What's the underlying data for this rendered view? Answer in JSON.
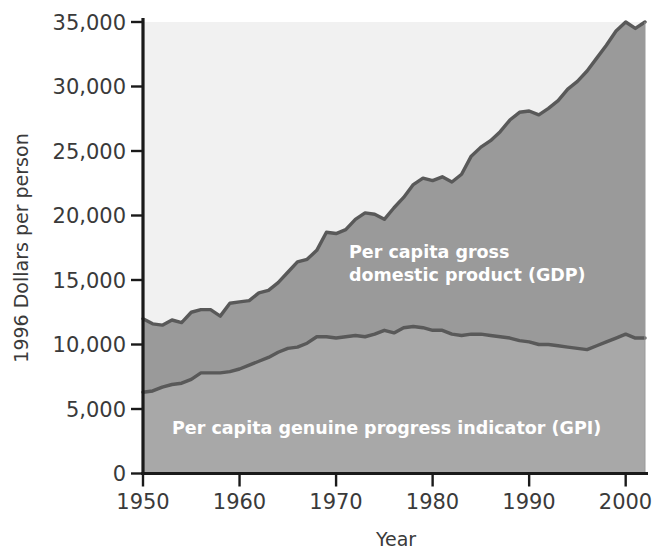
{
  "chart_data": {
    "type": "area",
    "title": "",
    "xlabel": "Year",
    "ylabel": "1996 Dollars per person",
    "xlim": [
      1950,
      2002
    ],
    "ylim": [
      0,
      35000
    ],
    "grid": false,
    "legend_position": "inline-annotation",
    "xticks": [
      "1950",
      "1960",
      "1970",
      "1980",
      "1990",
      "2000"
    ],
    "xtick_values": [
      1950,
      1960,
      1970,
      1980,
      1990,
      2000
    ],
    "yticks": [
      "0",
      "5,000",
      "10,000",
      "15,000",
      "20,000",
      "25,000",
      "30,000",
      "35,000"
    ],
    "ytick_values": [
      0,
      5000,
      10000,
      15000,
      20000,
      25000,
      30000,
      35000
    ],
    "x": [
      1950,
      1951,
      1952,
      1953,
      1954,
      1955,
      1956,
      1957,
      1958,
      1959,
      1960,
      1961,
      1962,
      1963,
      1964,
      1965,
      1966,
      1967,
      1968,
      1969,
      1970,
      1971,
      1972,
      1973,
      1974,
      1975,
      1976,
      1977,
      1978,
      1979,
      1980,
      1981,
      1982,
      1983,
      1984,
      1985,
      1986,
      1987,
      1988,
      1989,
      1990,
      1991,
      1992,
      1993,
      1994,
      1995,
      1996,
      1997,
      1998,
      1999,
      2000,
      2001,
      2002
    ],
    "series": [
      {
        "name": "Per capita gross domestic product (GDP)",
        "label": "Per capita gross domestic product (GDP)",
        "color": "#9a9a9a",
        "line_color": "#595959",
        "values": [
          12000,
          11600,
          11500,
          11900,
          11700,
          12500,
          12700,
          12700,
          12200,
          13200,
          13300,
          13400,
          14000,
          14200,
          14800,
          15600,
          16400,
          16600,
          17300,
          18700,
          18600,
          18900,
          19700,
          20200,
          20100,
          19700,
          20600,
          21400,
          22400,
          22900,
          22700,
          23000,
          22600,
          23200,
          24600,
          25300,
          25800,
          26500,
          27400,
          28000,
          28100,
          27800,
          28300,
          28900,
          29800,
          30400,
          31200,
          32200,
          33200,
          34300,
          35000,
          34500,
          35000
        ]
      },
      {
        "name": "Per capita genuine progress indicator (GPI)",
        "label": "Per capita genuine progress indicator (GPI)",
        "color": "#a8a8a8",
        "line_color": "#595959",
        "values": [
          6300,
          6400,
          6700,
          6900,
          7000,
          7300,
          7800,
          7800,
          7800,
          7900,
          8100,
          8400,
          8700,
          9000,
          9400,
          9700,
          9800,
          10100,
          10600,
          10600,
          10500,
          10600,
          10700,
          10600,
          10800,
          11100,
          10900,
          11300,
          11400,
          11300,
          11100,
          11100,
          10800,
          10700,
          10800,
          10800,
          10700,
          10600,
          10500,
          10300,
          10200,
          10000,
          10000,
          9900,
          9800,
          9700,
          9600,
          9900,
          10200,
          10500,
          10800,
          10500,
          10500
        ]
      }
    ],
    "annotations": [
      {
        "text_line1": "Per capita gross",
        "text_line2": "domestic product (GDP)",
        "x": 1972,
        "y": 17500
      },
      {
        "text_line1": "Per capita genuine progress indicator (GPI)",
        "text_line2": "",
        "x": 1963,
        "y": 4000
      }
    ],
    "colors": {
      "upper_background": "#f1f1f1",
      "gdp_band": "#9a9a9a",
      "gpi_band": "#a8a8a8",
      "line": "#595959",
      "axis": "#1a1a1a",
      "text": "#3a3a3a",
      "annotation_text": "#ffffff"
    }
  },
  "axis": {
    "y_title": "1996 Dollars per person",
    "x_title": "Year"
  },
  "labels": {
    "gdp_line1": "Per capita gross",
    "gdp_line2": "domestic product (GDP)",
    "gpi_line1": "Per capita genuine progress indicator (GPI)"
  },
  "yticks": {
    "t0": "0",
    "t1": "5,000",
    "t2": "10,000",
    "t3": "15,000",
    "t4": "20,000",
    "t5": "25,000",
    "t6": "30,000",
    "t7": "35,000"
  },
  "xticks": {
    "t0": "1950",
    "t1": "1960",
    "t2": "1970",
    "t3": "1980",
    "t4": "1990",
    "t5": "2000"
  }
}
